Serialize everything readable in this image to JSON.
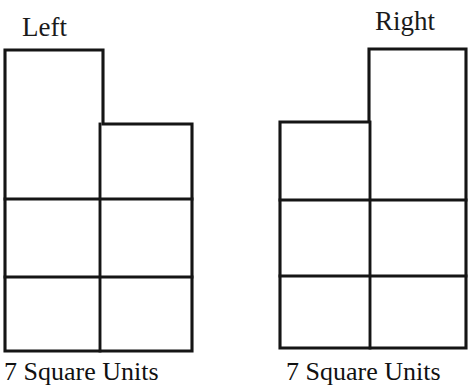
{
  "page": {
    "background_color": "#ffffff",
    "ink_color": "#151515",
    "width": 474,
    "height": 389
  },
  "figures": [
    {
      "id": "left-figure",
      "label": "Left",
      "caption": "7 Square Units",
      "area_units": 7,
      "shape": "heptomino",
      "description": "2 by 3 grid of unit squares with one extra unit square attached on top of the left column",
      "extra_square_position": "top-left",
      "columns": 2,
      "rows": 3,
      "extra_squares": 1,
      "geometry": {
        "outline_points": "5,50 103,50 103,124 192,124 192,351 5,351 5,50",
        "inner_lines": [
          "5,199 192,199",
          "5,277 192,277",
          "100,124 100,351"
        ]
      }
    },
    {
      "id": "right-figure",
      "label": "Right",
      "caption": "7 Square Units",
      "area_units": 7,
      "shape": "heptomino",
      "description": "2 by 3 grid of unit squares with one extra unit square attached on top of the right column",
      "extra_square_position": "top-right",
      "columns": 2,
      "rows": 3,
      "extra_squares": 1,
      "geometry": {
        "outline_points": "369,49 466,49 466,348 280,348 280,122 369,122 369,49",
        "inner_lines": [
          "280,200 466,200",
          "280,276 466,276",
          "370,122 370,348"
        ]
      }
    }
  ]
}
